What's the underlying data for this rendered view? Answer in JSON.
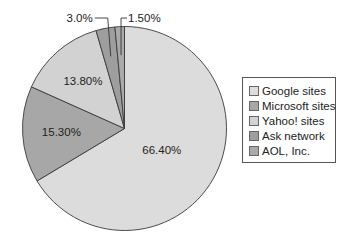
{
  "chart_data": {
    "type": "pie",
    "title": "",
    "start": "top",
    "direction": "clockwise",
    "slices": [
      {
        "name": "Google sites",
        "value": 66.4,
        "label": "66.40%",
        "color": "#dcdcdc"
      },
      {
        "name": "Microsoft sites",
        "value": 15.3,
        "label": "15.30%",
        "color": "#a7a7a7"
      },
      {
        "name": "Yahoo! sites",
        "value": 13.8,
        "label": "13.80%",
        "color": "#d2d2d2"
      },
      {
        "name": "Ask network",
        "value": 3.0,
        "label": "3.0%",
        "color": "#9e9e9e"
      },
      {
        "name": "AOL, Inc.",
        "value": 1.5,
        "label": "1.50%",
        "color": "#aaaaaa"
      }
    ],
    "legend": {
      "position": "right",
      "entries": [
        "Google sites",
        "Microsoft sites",
        "Yahoo! sites",
        "Ask network",
        "AOL, Inc."
      ]
    }
  }
}
